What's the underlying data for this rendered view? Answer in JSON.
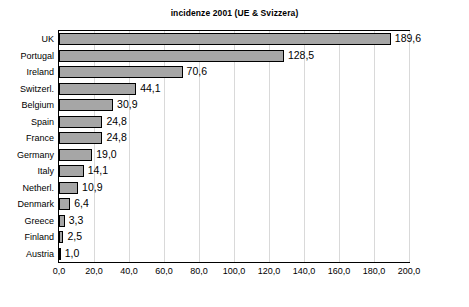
{
  "chart_data": {
    "type": "bar",
    "orientation": "horizontal",
    "title": "incidenze 2001 (UE & Svizzera)",
    "xlabel": "",
    "ylabel": "",
    "xlim": [
      0.0,
      200.0
    ],
    "xticks": [
      "0,0",
      "20,0",
      "40,0",
      "60,0",
      "80,0",
      "100,0",
      "120,0",
      "140,0",
      "160,0",
      "180,0",
      "200,0"
    ],
    "xtick_values": [
      0,
      20,
      40,
      60,
      80,
      100,
      120,
      140,
      160,
      180,
      200
    ],
    "grid": true,
    "legend": "none",
    "bar_color": "#a6a6a6",
    "bar_border_color": "#000000",
    "categories": [
      "UK",
      "Portugal",
      "Ireland",
      "Switzerl.",
      "Belgium",
      "Spain",
      "France",
      "Germany",
      "Italy",
      "Netherl.",
      "Denmark",
      "Greece",
      "Finland",
      "Austria"
    ],
    "values": [
      189.6,
      128.5,
      70.6,
      44.1,
      30.9,
      24.8,
      24.8,
      19.0,
      14.1,
      10.9,
      6.4,
      3.3,
      2.5,
      1.0
    ],
    "value_labels": [
      "189,6",
      "128,5",
      "70,6",
      "44,1",
      "30,9",
      "24,8",
      "24,8",
      "19,0",
      "14,1",
      "10,9",
      "6,4",
      "3,3",
      "2,5",
      "1,0"
    ]
  }
}
